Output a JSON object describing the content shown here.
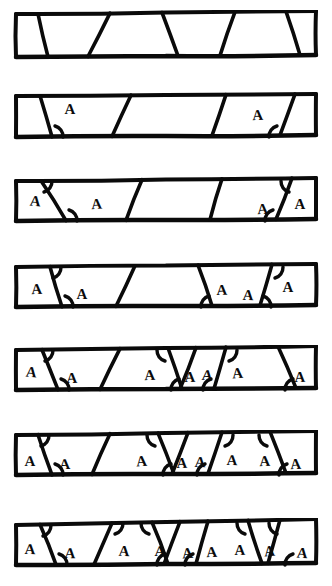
{
  "figure": {
    "ink_color": "#0a0a0a",
    "paper_color": "#ffffff",
    "angle_label": "A",
    "width": 332,
    "height": 586,
    "strip_count": 7,
    "caption": ""
  },
  "chart_data": {
    "type": "diagram",
    "xlabel": "",
    "ylabel": "",
    "categories": [
      "strip 1",
      "strip 2",
      "strip 3",
      "strip 4",
      "strip 5",
      "strip 6",
      "strip 7"
    ],
    "values": [
      0,
      2,
      4,
      5,
      7,
      8,
      9
    ],
    "series": [
      {
        "name": "labelled angles (A)",
        "values": [
          0,
          2,
          4,
          5,
          7,
          8,
          9
        ]
      },
      {
        "name": "transversal lines",
        "values": [
          4,
          3,
          4,
          4,
          6,
          6,
          7
        ]
      }
    ],
    "ylim": [
      0,
      10
    ],
    "grid": false,
    "legend": "none"
  },
  "strips": [
    {
      "index": 1,
      "y": 10,
      "height": 52,
      "label_count": 0,
      "top_left_y": 4,
      "top_right_y": 1,
      "bot_left_y": 47,
      "bot_right_y": 45,
      "transversals": [
        {
          "top_x": 38,
          "bot_x": 48
        },
        {
          "top_x": 110,
          "bot_x": 88
        },
        {
          "top_x": 162,
          "bot_x": 178
        },
        {
          "top_x": 235,
          "bot_x": 220
        },
        {
          "top_x": 286,
          "bot_x": 300
        }
      ],
      "angles": []
    },
    {
      "index": 2,
      "y": 92,
      "height": 48,
      "top_left_y": 4,
      "top_right_y": 2,
      "bot_left_y": 45,
      "bot_right_y": 43,
      "label_count": 2,
      "transversals": [
        {
          "top_x": 40,
          "bot_x": 52
        },
        {
          "top_x": 131,
          "bot_x": 112
        },
        {
          "top_x": 226,
          "bot_x": 212
        },
        {
          "top_x": 295,
          "bot_x": 280
        }
      ],
      "angles": [
        {
          "x": 70,
          "y": 22,
          "arc_x": 52,
          "arc_y": 45,
          "arc_dir": "br"
        },
        {
          "x": 258,
          "y": 28,
          "arc_x": 280,
          "arc_y": 45,
          "arc_dir": "bl"
        }
      ]
    },
    {
      "index": 3,
      "y": 176,
      "height": 48,
      "top_left_y": 5,
      "top_right_y": 2,
      "bot_left_y": 45,
      "bot_right_y": 43,
      "label_count": 4,
      "transversals": [
        {
          "top_x": 41,
          "bot_x": 66
        },
        {
          "top_x": 142,
          "bot_x": 126
        },
        {
          "top_x": 222,
          "bot_x": 210
        },
        {
          "top_x": 292,
          "bot_x": 276
        }
      ],
      "angles": [
        {
          "x": 35,
          "y": 30,
          "arc_x": 41,
          "arc_y": 5,
          "arc_dir": "tr"
        },
        {
          "x": 97,
          "y": 33,
          "arc_x": 66,
          "arc_y": 45,
          "arc_dir": "br"
        },
        {
          "x": 263,
          "y": 38,
          "arc_x": 276,
          "arc_y": 45,
          "arc_dir": "bl"
        },
        {
          "x": 300,
          "y": 33,
          "arc_x": 292,
          "arc_y": 5,
          "arc_dir": "tl"
        }
      ]
    },
    {
      "index": 4,
      "y": 262,
      "height": 48,
      "top_left_y": 5,
      "top_right_y": 2,
      "bot_left_y": 45,
      "bot_right_y": 43,
      "label_count": 5,
      "transversals": [
        {
          "top_x": 50,
          "bot_x": 62
        },
        {
          "top_x": 135,
          "bot_x": 116
        },
        {
          "top_x": 198,
          "bot_x": 212
        },
        {
          "top_x": 272,
          "bot_x": 260
        }
      ],
      "angles": [
        {
          "x": 37,
          "y": 32,
          "arc_x": 50,
          "arc_y": 5,
          "arc_dir": "tr"
        },
        {
          "x": 82,
          "y": 37,
          "arc_x": 62,
          "arc_y": 45,
          "arc_dir": "br"
        },
        {
          "x": 222,
          "y": 33,
          "arc_x": 212,
          "arc_y": 45,
          "arc_dir": "bl"
        },
        {
          "x": 248,
          "y": 38,
          "arc_x": 260,
          "arc_y": 45,
          "arc_dir": "br"
        },
        {
          "x": 288,
          "y": 30,
          "arc_x": 272,
          "arc_y": 5,
          "arc_dir": "tr"
        }
      ]
    },
    {
      "index": 5,
      "y": 345,
      "height": 48,
      "top_left_y": 5,
      "top_right_y": 1,
      "bot_left_y": 45,
      "bot_right_y": 43,
      "label_count": 7,
      "transversals": [
        {
          "top_x": 42,
          "bot_x": 58
        },
        {
          "top_x": 120,
          "bot_x": 100
        },
        {
          "top_x": 168,
          "bot_x": 182
        },
        {
          "top_x": 196,
          "bot_x": 180
        },
        {
          "top_x": 226,
          "bot_x": 214
        },
        {
          "top_x": 278,
          "bot_x": 296
        }
      ],
      "angles": [
        {
          "x": 31,
          "y": 32,
          "arc_x": 42,
          "arc_y": 5,
          "arc_dir": "tr"
        },
        {
          "x": 72,
          "y": 38,
          "arc_x": 58,
          "arc_y": 45,
          "arc_dir": "br"
        },
        {
          "x": 150,
          "y": 35,
          "arc_x": 168,
          "arc_y": 5,
          "arc_dir": "tl"
        },
        {
          "x": 190,
          "y": 37,
          "arc_x": 182,
          "arc_y": 45,
          "arc_dir": "bl"
        },
        {
          "x": 207,
          "y": 35,
          "arc_x": 214,
          "arc_y": 45,
          "arc_dir": "bl"
        },
        {
          "x": 238,
          "y": 33,
          "arc_x": 226,
          "arc_y": 5,
          "arc_dir": "tr"
        },
        {
          "x": 300,
          "y": 37,
          "arc_x": 296,
          "arc_y": 45,
          "arc_dir": "bl"
        }
      ]
    },
    {
      "index": 6,
      "y": 430,
      "height": 48,
      "top_left_y": 5,
      "top_right_y": 1,
      "bot_left_y": 45,
      "bot_right_y": 43,
      "label_count": 8,
      "transversals": [
        {
          "top_x": 38,
          "bot_x": 52
        },
        {
          "top_x": 110,
          "bot_x": 92
        },
        {
          "top_x": 158,
          "bot_x": 174
        },
        {
          "top_x": 188,
          "bot_x": 172
        },
        {
          "top_x": 222,
          "bot_x": 208
        },
        {
          "top_x": 270,
          "bot_x": 286
        }
      ],
      "angles": [
        {
          "x": 30,
          "y": 36,
          "arc_x": 38,
          "arc_y": 5,
          "arc_dir": "tr"
        },
        {
          "x": 65,
          "y": 39,
          "arc_x": 52,
          "arc_y": 45,
          "arc_dir": "br"
        },
        {
          "x": 142,
          "y": 36,
          "arc_x": 158,
          "arc_y": 5,
          "arc_dir": "tl"
        },
        {
          "x": 182,
          "y": 38,
          "arc_x": 174,
          "arc_y": 45,
          "arc_dir": "bl"
        },
        {
          "x": 200,
          "y": 37,
          "arc_x": 208,
          "arc_y": 45,
          "arc_dir": "bl"
        },
        {
          "x": 232,
          "y": 35,
          "arc_x": 222,
          "arc_y": 5,
          "arc_dir": "tr"
        },
        {
          "x": 265,
          "y": 36,
          "arc_x": 270,
          "arc_y": 5,
          "arc_dir": "tl"
        },
        {
          "x": 296,
          "y": 39,
          "arc_x": 290,
          "arc_y": 45,
          "arc_dir": "bl"
        }
      ]
    },
    {
      "index": 7,
      "y": 518,
      "height": 50,
      "top_left_y": 7,
      "top_right_y": 1,
      "bot_left_y": 47,
      "bot_right_y": 45,
      "label_count": 9,
      "transversals": [
        {
          "top_x": 40,
          "bot_x": 56
        },
        {
          "top_x": 112,
          "bot_x": 94
        },
        {
          "top_x": 152,
          "bot_x": 168
        },
        {
          "top_x": 180,
          "bot_x": 164
        },
        {
          "top_x": 208,
          "bot_x": 196
        },
        {
          "top_x": 248,
          "bot_x": 262
        },
        {
          "top_x": 280,
          "bot_x": 268
        }
      ],
      "angles": [
        {
          "x": 30,
          "y": 36,
          "arc_x": 40,
          "arc_y": 7,
          "arc_dir": "tr"
        },
        {
          "x": 70,
          "y": 40,
          "arc_x": 56,
          "arc_y": 47,
          "arc_dir": "br"
        },
        {
          "x": 124,
          "y": 38,
          "arc_x": 112,
          "arc_y": 5,
          "arc_dir": "tr"
        },
        {
          "x": 160,
          "y": 38,
          "arc_x": 152,
          "arc_y": 5,
          "arc_dir": "tl"
        },
        {
          "x": 188,
          "y": 40,
          "arc_x": 168,
          "arc_y": 47,
          "arc_dir": "bl"
        },
        {
          "x": 212,
          "y": 39,
          "arc_x": 196,
          "arc_y": 47,
          "arc_dir": "bl"
        },
        {
          "x": 240,
          "y": 37,
          "arc_x": 248,
          "arc_y": 5,
          "arc_dir": "tl"
        },
        {
          "x": 270,
          "y": 38,
          "arc_x": 280,
          "arc_y": 5,
          "arc_dir": "tl"
        },
        {
          "x": 302,
          "y": 40,
          "arc_x": 296,
          "arc_y": 47,
          "arc_dir": "bl"
        }
      ]
    }
  ]
}
